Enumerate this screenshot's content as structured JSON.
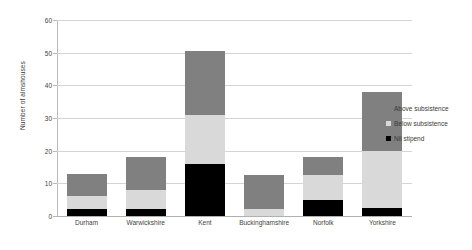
{
  "chart_data": {
    "type": "bar",
    "title": "",
    "subtitle": "",
    "xlabel": "",
    "ylabel": "Number of almshouses",
    "stacked": true,
    "grid": true,
    "legend_position": "right",
    "ylim": [
      0,
      60
    ],
    "yticks": [
      0,
      10,
      20,
      30,
      40,
      50,
      60
    ],
    "ytick_labels": [
      "0",
      "10",
      "20",
      "30",
      "40",
      "50",
      "60"
    ],
    "categories": [
      "Durham",
      "Warwickshire",
      "Kent",
      "Buckinghamshire",
      "Norfolk",
      "Yorkshire"
    ],
    "series": [
      {
        "name": "Nil stipend",
        "color": "#000000",
        "values": [
          2,
          2,
          16,
          0,
          5,
          2.5
        ]
      },
      {
        "name": "Below subsistence",
        "color": "#d9d9d9",
        "values": [
          4,
          6,
          15,
          2,
          7.5,
          17.5
        ]
      },
      {
        "name": "Above subsistence",
        "color": "#808080",
        "values": [
          7,
          10,
          19.5,
          10.5,
          5.5,
          18
        ]
      }
    ],
    "totals": [
      13,
      18,
      50.5,
      12.5,
      18,
      38
    ],
    "legend_entries": [
      "Above subsistence",
      "Below subsistence",
      "Nil stipend"
    ]
  },
  "colors": {
    "above_subsistence": "#808080",
    "below_subsistence": "#d9d9d9",
    "nil_stipend": "#000000",
    "gridline": "#d4d4d4",
    "axis": "#b9b9b9",
    "text": "#3f3f3f",
    "background": "#ffffff"
  }
}
